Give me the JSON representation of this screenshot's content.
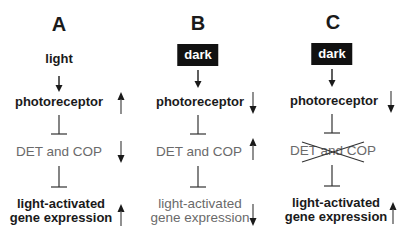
{
  "figure": {
    "colors": {
      "ink": "#1a1a1a",
      "muted_text": "#6a6a6a",
      "dark_box_bg": "#111111",
      "dark_box_text": "#ffffff"
    },
    "columns": [
      {
        "letter": "A",
        "signal": "light",
        "signal_style": "plain",
        "photoreceptor": {
          "label": "photoreceptor",
          "indicator": "up"
        },
        "det_cop": {
          "label": "DET and COP",
          "indicator": "down",
          "crossed_out": false
        },
        "output": {
          "line1": "light-activated",
          "line2": "gene expression",
          "indicator": "up",
          "emphasis": "bold"
        }
      },
      {
        "letter": "B",
        "signal": "dark",
        "signal_style": "boxed",
        "photoreceptor": {
          "label": "photoreceptor",
          "indicator": "down"
        },
        "det_cop": {
          "label": "DET and COP",
          "indicator": "up",
          "crossed_out": false
        },
        "output": {
          "line1": "light-activated",
          "line2": "gene expression",
          "indicator": "down",
          "emphasis": "light"
        }
      },
      {
        "letter": "C",
        "signal": "dark",
        "signal_style": "boxed",
        "photoreceptor": {
          "label": "photoreceptor",
          "indicator": "down"
        },
        "det_cop": {
          "label": "DET and COP",
          "indicator": "none",
          "crossed_out": true
        },
        "output": {
          "line1": "light-activated",
          "line2": "gene expression",
          "indicator": "up",
          "emphasis": "bold"
        }
      }
    ],
    "relations": {
      "signal_to_photoreceptor": "activation-arrow",
      "photoreceptor_to_det_cop": "inhibition-bar",
      "det_cop_to_output": "inhibition-bar"
    }
  }
}
